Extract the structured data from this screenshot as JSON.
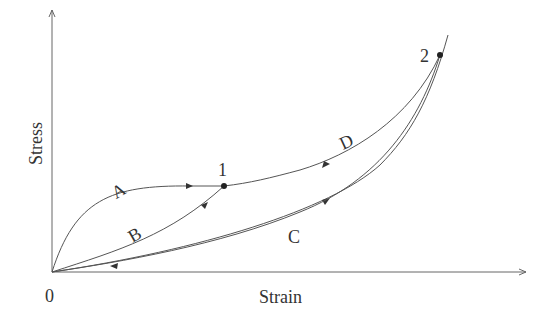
{
  "diagram": {
    "type": "stress-strain loading/unloading curves",
    "axes": {
      "xlabel": "Strain",
      "ylabel": "Stress",
      "origin_label": "0"
    },
    "points": [
      {
        "id": "1",
        "label": "1",
        "description": "intermediate state"
      },
      {
        "id": "2",
        "label": "2",
        "description": "maximum loading state"
      }
    ],
    "paths": [
      {
        "label": "A",
        "from": "0",
        "to": "1",
        "direction": "loading"
      },
      {
        "label": "B",
        "from": "0",
        "to": "1",
        "direction": "loading"
      },
      {
        "label": "C",
        "from": "0",
        "to": "2",
        "direction": "loading, then unloading back to 0"
      },
      {
        "label": "D",
        "from": "2",
        "to": "1",
        "direction": "unloading"
      }
    ],
    "colors": {
      "curve": "#555555",
      "axis": "#666666",
      "text": "#333333",
      "background": "#ffffff"
    }
  }
}
